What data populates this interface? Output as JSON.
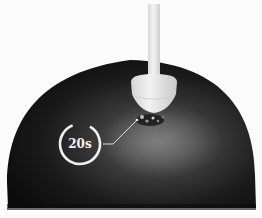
{
  "scene": {
    "description": "Dark head surface with a white probe/applicator pressing into it; timer annotation with leader line",
    "colors": {
      "background": "#fbfbfb",
      "head_dark": "#0e0e0e",
      "head_highlight": "#6a6a6a",
      "probe": "#e4e4e4",
      "timer_ring": "#f0f0f0"
    }
  },
  "timer": {
    "label": "20s",
    "progress_percent": 85
  }
}
